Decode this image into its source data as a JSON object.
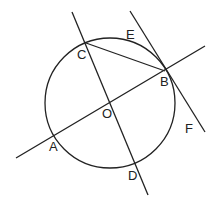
{
  "diagram": {
    "colors": {
      "stroke": "#222222",
      "background": "#ffffff"
    },
    "circle": {
      "center": "O",
      "cx": 110,
      "cy": 103,
      "r": 65
    },
    "points": {
      "A": {
        "label": "A",
        "x": 54,
        "y": 137,
        "lx": 49,
        "ly": 151
      },
      "B": {
        "label": "B",
        "x": 165,
        "y": 71,
        "lx": 160,
        "ly": 86
      },
      "C": {
        "label": "C",
        "x": 86,
        "y": 43,
        "lx": 77,
        "ly": 59
      },
      "D": {
        "label": "D",
        "x": 135,
        "y": 165,
        "lx": 128,
        "ly": 180
      },
      "O": {
        "label": "O",
        "x": 109,
        "y": 104,
        "lx": 102,
        "ly": 118
      },
      "E": {
        "label": "E",
        "lx": 126,
        "ly": 39
      },
      "F": {
        "label": "F",
        "lx": 185,
        "ly": 133
      }
    },
    "lines": [
      {
        "name": "line-cd",
        "x1": 72,
        "y1": 12,
        "x2": 148,
        "y2": 195
      },
      {
        "name": "line-ab",
        "x1": 16,
        "y1": 158,
        "x2": 205,
        "y2": 46
      },
      {
        "name": "tangent-ef",
        "x1": 130,
        "y1": 11,
        "x2": 205,
        "y2": 132
      },
      {
        "name": "chord-cb",
        "x1": 86,
        "y1": 43,
        "x2": 165,
        "y2": 71
      }
    ]
  }
}
